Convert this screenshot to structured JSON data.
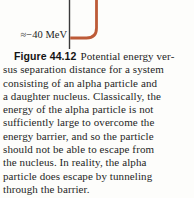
{
  "figure": {
    "plot": {
      "annotation_energy_level": "≈−40 MeV",
      "curve_description": "potential energy curve fragment: vertical barrier wall descending to flat well bottom at ≈−40 MeV meeting the energy axis",
      "colors": {
        "curve": "#bd5b38",
        "axis": "#3a3a3a",
        "background": "#fdfdfb",
        "text": "#242424"
      }
    },
    "caption": {
      "label": "Figure 44.12",
      "line1_rest": "Potential energy ver-",
      "lines": [
        "sus separation distance for a system",
        "consisting of an alpha particle and",
        "a daughter nucleus. Classically, the",
        "energy of the alpha particle is not",
        "sufficiently large to overcome the",
        "energy barrier, and so the particle",
        "should not be able to escape from",
        "the nucleus. In reality, the alpha",
        "particle does escape by tunneling",
        "through the barrier."
      ]
    }
  }
}
